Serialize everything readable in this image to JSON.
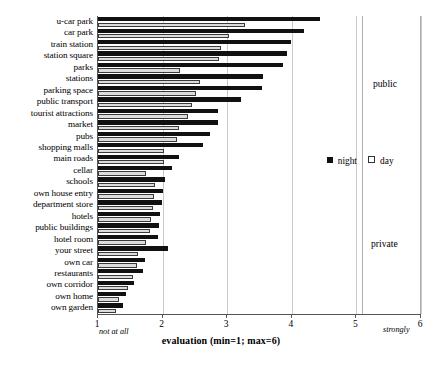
{
  "chart_data": {
    "type": "bar",
    "title": "",
    "orientation": "horizontal",
    "xlabel": "evaluation (min=1; max=6)",
    "ylabel": "",
    "xlim": [
      1,
      6
    ],
    "xticks": [
      1,
      2,
      3,
      4,
      5,
      6
    ],
    "xtick_labels": [
      "1",
      "2",
      "3",
      "4",
      "5",
      "6"
    ],
    "x_axis_low_note": "not at all",
    "x_axis_high_note": "strongly",
    "grid": true,
    "legend_position": "right-middle",
    "categories": [
      "u-car park",
      "car park",
      "train station",
      "station square",
      "parks",
      "stations",
      "parking space",
      "public transport",
      "tourist attractions",
      "market",
      "pubs",
      "shopping malls",
      "main roads",
      "cellar",
      "schools",
      "own house entry",
      "department store",
      "hotels",
      "public buildings",
      "hotel room",
      "your street",
      "own car",
      "restaurants",
      "own corridor",
      "own home",
      "own garden"
    ],
    "series": [
      {
        "name": "night",
        "color": "#111111",
        "values": [
          4.44,
          4.19,
          3.98,
          3.93,
          3.87,
          3.56,
          3.54,
          3.22,
          2.86,
          2.86,
          2.74,
          2.62,
          2.25,
          2.15,
          2.03,
          2.0,
          1.99,
          1.96,
          1.94,
          1.93,
          2.08,
          1.72,
          1.7,
          1.55,
          1.43,
          1.38
        ]
      },
      {
        "name": "day",
        "color": "#dcdcdc",
        "values": [
          3.27,
          3.03,
          2.9,
          2.88,
          2.27,
          2.58,
          2.52,
          2.46,
          2.4,
          2.25,
          2.23,
          2.02,
          2.02,
          1.74,
          1.88,
          1.86,
          1.85,
          1.82,
          1.81,
          1.75,
          1.62,
          1.6,
          1.54,
          1.47,
          1.33,
          1.28
        ]
      }
    ],
    "annotations": [
      {
        "label": "public",
        "position": "right"
      },
      {
        "label": "private",
        "position": "right"
      }
    ]
  },
  "legend": {
    "items": [
      {
        "label": "night",
        "swatch": "filled-square"
      },
      {
        "label": "day",
        "swatch": "open-square"
      }
    ]
  }
}
